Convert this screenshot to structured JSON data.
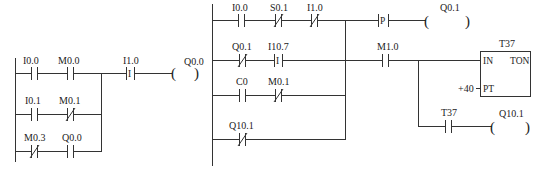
{
  "diagram": {
    "type": "ladder-logic",
    "networks": [
      {
        "id": "network-left",
        "branches": [
          {
            "contacts": [
              {
                "label": "I0.0",
                "type": "NO"
              },
              {
                "label": "M0.0",
                "type": "NO"
              }
            ]
          },
          {
            "contacts": [
              {
                "label": "I0.1",
                "type": "NO"
              },
              {
                "label": "M0.1",
                "type": "NC"
              }
            ]
          },
          {
            "contacts": [
              {
                "label": "M0.3",
                "type": "NC"
              },
              {
                "label": "Q0.0",
                "type": "NO"
              }
            ]
          }
        ],
        "series": [
          {
            "label": "I1.0",
            "type": "immediate",
            "glyph": "I"
          }
        ],
        "coil": {
          "label": "Q0.0"
        }
      },
      {
        "id": "network-right",
        "branches": [
          {
            "contacts": [
              {
                "label": "I0.0",
                "type": "NO"
              },
              {
                "label": "S0.1",
                "type": "NC"
              },
              {
                "label": "I1.0",
                "type": "NC"
              }
            ]
          },
          {
            "contacts": [
              {
                "label": "Q0.1",
                "type": "NC"
              },
              {
                "label": "I10.7",
                "type": "immediate",
                "glyph": "I"
              }
            ]
          },
          {
            "contacts": [
              {
                "label": "C0",
                "type": "NO"
              },
              {
                "label": "M0.1",
                "type": "NC"
              }
            ]
          },
          {
            "contacts": [
              {
                "label": "Q10.1",
                "type": "NC"
              }
            ]
          }
        ],
        "outputs": [
          {
            "series": [
              {
                "label": "",
                "type": "positive-edge",
                "glyph": "P"
              }
            ],
            "coil": {
              "label": "Q0.1"
            }
          },
          {
            "series": [
              {
                "label": "M1.0",
                "type": "NO"
              }
            ],
            "timer": {
              "name": "T37",
              "type": "TON",
              "in": "IN",
              "pt": "PT",
              "preset": "+40"
            },
            "sub": {
              "contact": {
                "label": "T37",
                "type": "NO"
              },
              "coil": {
                "label": "Q10.1"
              }
            }
          }
        ]
      }
    ]
  },
  "labels": {
    "l_i00": "I0.0",
    "l_m00": "M0.0",
    "l_i01": "I0.1",
    "l_m01": "M0.1",
    "l_m03": "M0.3",
    "l_q00c": "Q0.0",
    "l_i10": "I1.0",
    "l_i10g": "I",
    "l_q00": "Q0.0",
    "r_i00": "I0.0",
    "r_s01": "S0.1",
    "r_i10": "I1.0",
    "r_q01c": "Q0.1",
    "r_i107": "I10.7",
    "r_i107g": "I",
    "r_c0": "C0",
    "r_m01": "M0.1",
    "r_q101c": "Q10.1",
    "r_p": "P",
    "r_q01": "Q0.1",
    "r_m10": "M1.0",
    "t_name": "T37",
    "t_in": "IN",
    "t_type": "TON",
    "t_pt": "PT",
    "t_preset": "+40",
    "r_t37": "T37",
    "r_q101": "Q10.1",
    "coil_open": "(",
    "coil_close": ")"
  }
}
